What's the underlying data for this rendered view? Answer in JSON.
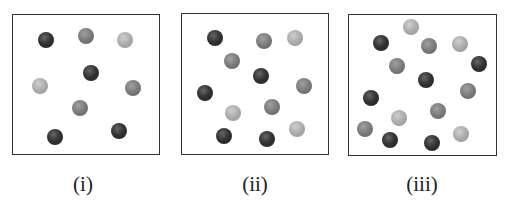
{
  "figure": {
    "panels": [
      {
        "label": "(i)",
        "box": {
          "x": 12,
          "y": 14,
          "w": 148,
          "h": 141
        },
        "label_pos": {
          "x": 83,
          "y": 172
        },
        "particles": [
          {
            "type": "dark",
            "x": 46,
            "y": 40
          },
          {
            "type": "medium",
            "x": 86,
            "y": 36
          },
          {
            "type": "light",
            "x": 125,
            "y": 40
          },
          {
            "type": "dark",
            "x": 91,
            "y": 73
          },
          {
            "type": "light",
            "x": 40,
            "y": 86
          },
          {
            "type": "medium",
            "x": 133,
            "y": 88
          },
          {
            "type": "medium",
            "x": 80,
            "y": 108
          },
          {
            "type": "dark",
            "x": 55,
            "y": 137
          },
          {
            "type": "dark",
            "x": 119,
            "y": 131
          }
        ]
      },
      {
        "label": "(ii)",
        "box": {
          "x": 181,
          "y": 13,
          "w": 148,
          "h": 142
        },
        "label_pos": {
          "x": 255,
          "y": 172
        },
        "particles": [
          {
            "type": "dark",
            "x": 215,
            "y": 38
          },
          {
            "type": "medium",
            "x": 264,
            "y": 41
          },
          {
            "type": "light",
            "x": 295,
            "y": 38
          },
          {
            "type": "medium",
            "x": 232,
            "y": 61
          },
          {
            "type": "dark",
            "x": 261,
            "y": 76
          },
          {
            "type": "medium",
            "x": 304,
            "y": 86
          },
          {
            "type": "dark",
            "x": 205,
            "y": 93
          },
          {
            "type": "light",
            "x": 233,
            "y": 113
          },
          {
            "type": "medium",
            "x": 272,
            "y": 107
          },
          {
            "type": "dark",
            "x": 224,
            "y": 136
          },
          {
            "type": "dark",
            "x": 267,
            "y": 139
          },
          {
            "type": "light",
            "x": 297,
            "y": 129
          }
        ]
      },
      {
        "label": "(iii)",
        "box": {
          "x": 348,
          "y": 14,
          "w": 149,
          "h": 142
        },
        "label_pos": {
          "x": 422,
          "y": 172
        },
        "particles": [
          {
            "type": "light",
            "x": 411,
            "y": 27
          },
          {
            "type": "dark",
            "x": 381,
            "y": 43
          },
          {
            "type": "medium",
            "x": 429,
            "y": 46
          },
          {
            "type": "light",
            "x": 460,
            "y": 44
          },
          {
            "type": "medium",
            "x": 397,
            "y": 66
          },
          {
            "type": "dark",
            "x": 479,
            "y": 64
          },
          {
            "type": "dark",
            "x": 426,
            "y": 80
          },
          {
            "type": "medium",
            "x": 468,
            "y": 91
          },
          {
            "type": "dark",
            "x": 371,
            "y": 98
          },
          {
            "type": "light",
            "x": 399,
            "y": 118
          },
          {
            "type": "medium",
            "x": 438,
            "y": 111
          },
          {
            "type": "medium",
            "x": 365,
            "y": 129
          },
          {
            "type": "dark",
            "x": 390,
            "y": 140
          },
          {
            "type": "dark",
            "x": 432,
            "y": 143
          },
          {
            "type": "light",
            "x": 461,
            "y": 134
          }
        ]
      }
    ],
    "colors": {
      "border": "#333333",
      "dark": "#333333",
      "medium": "#777777",
      "light": "#aaaaaa"
    }
  }
}
